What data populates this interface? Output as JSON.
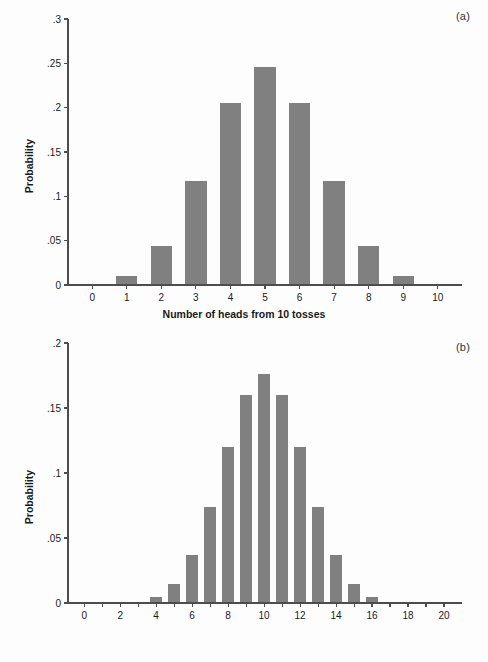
{
  "figure": {
    "background": "#fdfdfd",
    "bar_color": "#808080",
    "axis_color": "#4d4d4d",
    "text_color": "#1a1a1a"
  },
  "panels": [
    {
      "tag": "(a)",
      "ylabel": "Probability",
      "xlabel": "Number of heads from 10 tosses",
      "yticks": [
        "0",
        ".05",
        ".1",
        ".15",
        ".2",
        ".25",
        ".3"
      ],
      "xticks": [
        "0",
        "1",
        "2",
        "3",
        "4",
        "5",
        "6",
        "7",
        "8",
        "9",
        "10"
      ]
    },
    {
      "tag": "(b)",
      "ylabel": "Probability",
      "xlabel": "Number of heads from 20 tosses",
      "yticks": [
        "0",
        ".05",
        ".1",
        ".15",
        ".2"
      ],
      "xticks": [
        "0",
        "",
        "2",
        "",
        "4",
        "",
        "6",
        "",
        "8",
        "",
        "10",
        "",
        "12",
        "",
        "14",
        "",
        "16",
        "",
        "18",
        "",
        "20"
      ]
    }
  ],
  "chart_data": [
    {
      "type": "bar",
      "title": "(a)",
      "xlabel": "Number of heads from 10 tosses",
      "ylabel": "Probability",
      "categories": [
        0,
        1,
        2,
        3,
        4,
        5,
        6,
        7,
        8,
        9,
        10
      ],
      "values": [
        0.00098,
        0.00977,
        0.04395,
        0.11719,
        0.20508,
        0.24609,
        0.20508,
        0.11719,
        0.04395,
        0.00977,
        0.00098
      ],
      "ylim": [
        0,
        0.3
      ],
      "ytick_values": [
        0,
        0.05,
        0.1,
        0.15,
        0.2,
        0.25,
        0.3
      ],
      "ytick_labels": [
        "0",
        ".05",
        ".1",
        ".15",
        ".2",
        ".25",
        ".3"
      ],
      "xlim": [
        -0.7,
        10.7
      ],
      "grid": false,
      "legend": "none",
      "bar_color": "#808080"
    },
    {
      "type": "bar",
      "title": "(b)",
      "xlabel": "Number of heads from 20 tosses",
      "ylabel": "Probability",
      "categories": [
        0,
        1,
        2,
        3,
        4,
        5,
        6,
        7,
        8,
        9,
        10,
        11,
        12,
        13,
        14,
        15,
        16,
        17,
        18,
        19,
        20
      ],
      "values": [
        1e-06,
        1.9e-05,
        0.000181,
        0.001087,
        0.004621,
        0.014786,
        0.036964,
        0.073929,
        0.120134,
        0.160179,
        0.176197,
        0.160179,
        0.120134,
        0.073929,
        0.036964,
        0.014786,
        0.004621,
        0.001087,
        0.000181,
        1.9e-05,
        1e-06
      ],
      "ylim": [
        0,
        0.2
      ],
      "ytick_values": [
        0,
        0.05,
        0.1,
        0.15,
        0.2
      ],
      "ytick_labels": [
        "0",
        ".05",
        ".1",
        ".15",
        ".2"
      ],
      "xlim": [
        -0.9,
        21.0
      ],
      "grid": false,
      "legend": "none",
      "bar_color": "#808080"
    }
  ]
}
